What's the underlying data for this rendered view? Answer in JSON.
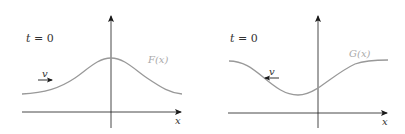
{
  "colors": {
    "axis": "#1a1a1a",
    "curve": "#999999",
    "curve_label": "#aaaaaa",
    "text": "#333333",
    "background": "#ffffff"
  },
  "panels": [
    {
      "id": "left",
      "time_label": {
        "var": "t",
        "eq": " = 0"
      },
      "function_label": "F(x)",
      "x_axis_label": "x",
      "velocity_label": "v",
      "velocity_direction": "right",
      "curve_shape": "bump (maximum at origin)"
    },
    {
      "id": "right",
      "time_label": {
        "var": "t",
        "eq": " = 0"
      },
      "function_label": "G(x)",
      "x_axis_label": "x",
      "velocity_label": "v",
      "velocity_direction": "left",
      "curve_shape": "dip (minimum left of origin)"
    }
  ]
}
